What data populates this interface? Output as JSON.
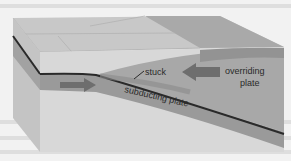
{
  "diagram": {
    "labels": {
      "stuck": "stuck",
      "overriding": [
        "overriding",
        "plate"
      ],
      "subducting": "subducting plate"
    },
    "colors": {
      "background": "#f2f2f2",
      "top_surface": "#c8c8c8",
      "overriding_plate": "#a8a8a8",
      "subducting_plate": "#9a9a9a",
      "mantle": "#dcdcdc",
      "front_face": "#d8d8d8",
      "left_face": "#c4c4c4",
      "arrow": "#6e6e6e",
      "fault_line": "#2a2a2a"
    }
  }
}
